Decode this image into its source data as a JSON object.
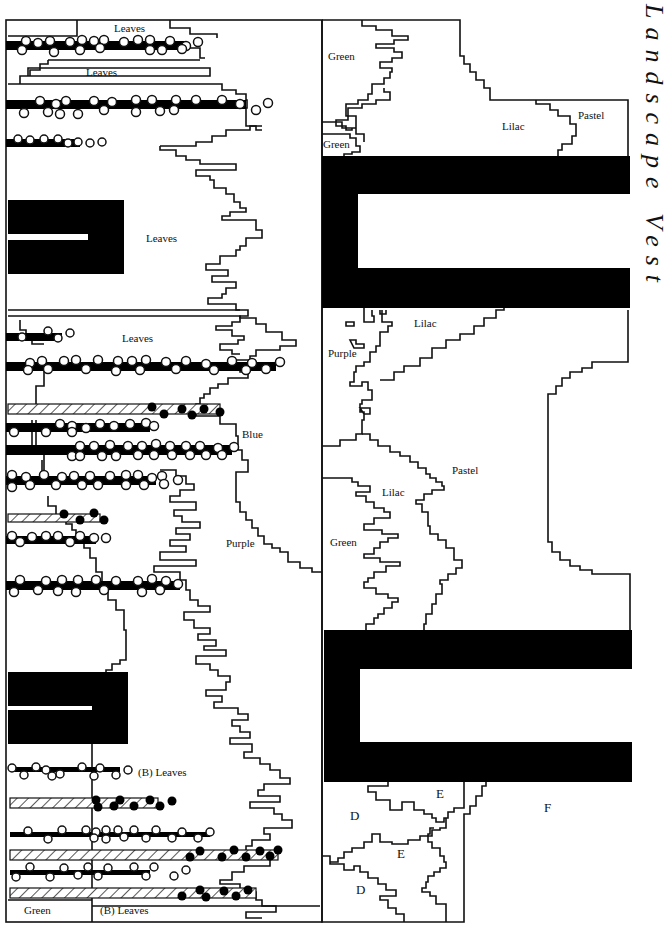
{
  "title": "Landscape Vest",
  "left_panel": {
    "labels": {
      "leaves_top": "Leaves",
      "leaves_band": "Leaves",
      "leaves_mid": "Leaves",
      "leaves_lower": "Leaves",
      "blue": "Blue",
      "purple": "Purple",
      "b_leaves_1": "(B) Leaves",
      "b_leaves_2": "(B) Leaves",
      "green_bottom": "Green"
    }
  },
  "right_panel": {
    "labels": {
      "green_top": "Green",
      "green_small": "Green",
      "lilac_top": "Lilac",
      "pastel_top": "Pastel",
      "lilac_mid": "Lilac",
      "purple_mid": "Purple",
      "pastel_mid": "Pastel",
      "lilac_low": "Lilac",
      "green_low": "Green",
      "e_top": "E",
      "d_top": "D",
      "f": "F",
      "e_low": "E",
      "d_low": "D"
    }
  },
  "colors": {
    "ink": "#111111",
    "fill_solid": "#000000",
    "background": "#ffffff"
  }
}
